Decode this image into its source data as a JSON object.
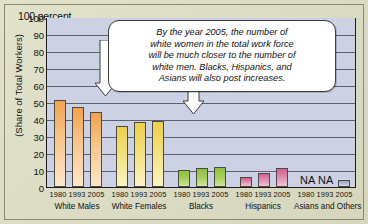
{
  "chart_data": {
    "type": "bar",
    "title": "",
    "subtitle": "",
    "xlabel": "",
    "ylabel": "(Share of Total Workers)",
    "y_unit_label": "100 percent",
    "ylim": [
      0,
      100
    ],
    "yticks": [
      100,
      90,
      80,
      70,
      60,
      50,
      40,
      30,
      20,
      10,
      0
    ],
    "ytick_labels": [
      "100",
      "90",
      "80",
      "70",
      "60",
      "50",
      "40",
      "30",
      "20",
      "10",
      "0"
    ],
    "grid": true,
    "legend": "none",
    "categories": [
      "White Males",
      "White Females",
      "Blacks",
      "Hispanics",
      "Asians and Others"
    ],
    "series_names": [
      "1980",
      "1993",
      "2005"
    ],
    "groups": [
      {
        "name": "White Males",
        "color": "#f2a24e",
        "years": [
          "1980",
          "1993",
          "2005"
        ],
        "values": [
          51,
          47,
          44
        ],
        "labels": [
          "",
          "",
          ""
        ]
      },
      {
        "name": "White Females",
        "color": "#ecd04a",
        "years": [
          "1980",
          "1993",
          "2005"
        ],
        "values": [
          36,
          38,
          39
        ],
        "labels": [
          "",
          "",
          ""
        ]
      },
      {
        "name": "Blacks",
        "color": "#8cc03c",
        "years": [
          "1980",
          "1993",
          "2005"
        ],
        "values": [
          10,
          11,
          12
        ],
        "labels": [
          "",
          "",
          ""
        ]
      },
      {
        "name": "Hispanics",
        "color": "#d4608c",
        "years": [
          "1980",
          "1993",
          "2005"
        ],
        "values": [
          6,
          8,
          11
        ],
        "labels": [
          "",
          "",
          ""
        ]
      },
      {
        "name": "Asians and Others",
        "color": "#9aa4c8",
        "years": [
          "1980",
          "1993",
          "2005"
        ],
        "values": [
          null,
          null,
          4
        ],
        "labels": [
          "NA",
          "NA",
          ""
        ]
      }
    ],
    "annotations": [
      {
        "kind": "callout",
        "text": "By the year 2005, the number of white women in the total work force will be much closer to the number of white men. Blacks, Hispanics, and Asians will also post increases.",
        "lines": [
          "By the year 2005, the number of",
          "white women in the total work force",
          "will be much closer to the number of",
          "white men. Blacks, Hispanics, and",
          "Asians will also post increases."
        ],
        "points_to": [
          "White Males 2005",
          "White Females 2005"
        ]
      }
    ]
  },
  "colors": {
    "page_background": "#dcdcc4",
    "plot_background": "#ccd2e4",
    "axis": "#111111",
    "gridline": "#5b6070",
    "callout_background": "#ffffff",
    "callout_border": "#3c3c3c"
  },
  "na_text": "NA"
}
